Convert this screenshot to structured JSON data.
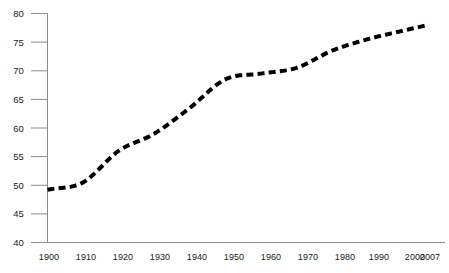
{
  "chart_data": {
    "type": "line",
    "title": "",
    "subtitle": "",
    "xlabel": "",
    "ylabel": "",
    "x": [
      1900,
      1910,
      1920,
      1930,
      1940,
      1950,
      1960,
      1970,
      1980,
      1990,
      2000,
      2007
    ],
    "categories": [
      "1900",
      "1910",
      "1920",
      "1930",
      "1940",
      "1950",
      "1960",
      "1970",
      "1980",
      "1990",
      "2000",
      "2007"
    ],
    "values": [
      49.2,
      50.5,
      56.0,
      59.0,
      63.5,
      68.5,
      69.5,
      70.5,
      73.5,
      75.5,
      77.0,
      78.0
    ],
    "series": [
      {
        "name": "",
        "values": [
          49.2,
          50.5,
          56.0,
          59.0,
          63.5,
          68.5,
          69.5,
          70.5,
          73.5,
          75.5,
          77.0,
          78.0
        ],
        "color": "#000000",
        "line_style": "dashed",
        "line_width": 4
      }
    ],
    "xlim": [
      1900,
      2007
    ],
    "ylim": [
      40,
      80
    ],
    "ytick_labels": [
      "40",
      "45",
      "50",
      "55",
      "60",
      "65",
      "70",
      "75",
      "80"
    ],
    "yticks": [
      40,
      45,
      50,
      55,
      60,
      65,
      70,
      75,
      80
    ],
    "xtick_labels": [
      "1900",
      "1910",
      "1920",
      "1930",
      "1940",
      "1950",
      "1960",
      "1970",
      "1980",
      "1990",
      "2000",
      "2007"
    ],
    "grid": false,
    "legend": false,
    "legend_position": "none",
    "axis_color": "#8a8a8a",
    "tick_color": "#8a8a8a",
    "text_color": "#1a1a1a",
    "background_color": "#ffffff"
  }
}
